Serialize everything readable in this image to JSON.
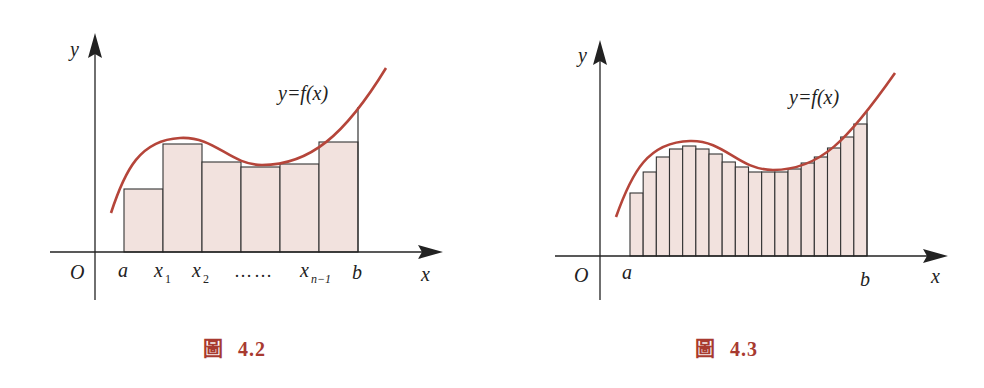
{
  "colors": {
    "curve": "#b5453a",
    "bar_fill": "#f2e2de",
    "bar_stroke": "#333333",
    "axis": "#222222",
    "caption": "#a83a30"
  },
  "figures": [
    {
      "id": "fig-4-2",
      "caption_label": "圖",
      "caption_number": "4.2",
      "axis_labels": {
        "x": "x",
        "y": "y",
        "origin": "O"
      },
      "curve_label": "y=f(x)",
      "x_tick_labels": [
        {
          "text": "a",
          "sub": ""
        },
        {
          "text": "x",
          "sub": "1"
        },
        {
          "text": "x",
          "sub": "2"
        },
        {
          "text": "……",
          "sub": ""
        },
        {
          "text": "x",
          "sub": "n−1"
        },
        {
          "text": "b",
          "sub": ""
        }
      ]
    },
    {
      "id": "fig-4-3",
      "caption_label": "圖",
      "caption_number": "4.3",
      "axis_labels": {
        "x": "x",
        "y": "y",
        "origin": "O"
      },
      "curve_label": "y=f(x)",
      "x_tick_labels": [
        {
          "text": "a",
          "sub": ""
        },
        {
          "text": "b",
          "sub": ""
        }
      ]
    }
  ],
  "chart_data": [
    {
      "type": "bar",
      "title": "圖 4.2 — Riemann sum approximation with n rectangles (left endpoints)",
      "xlabel": "x",
      "ylabel": "y",
      "curve": "y=f(x)",
      "categories": [
        "[a,x1]",
        "[x1,x2]",
        "[x2,x3]",
        "[x3,x4]",
        "[x4,xn-1]",
        "[xn-1,b]"
      ],
      "values": [
        63,
        108,
        90,
        85,
        88,
        110
      ],
      "value_units": "pixel heights above x-axis (relative)",
      "f_at_b": 145,
      "grid": false,
      "legend": "none"
    },
    {
      "type": "bar",
      "title": "圖 4.3 — Riemann sum approximation with finer partition (18 rectangles)",
      "xlabel": "x",
      "ylabel": "y",
      "curve": "y=f(x)",
      "categories": [
        "1",
        "2",
        "3",
        "4",
        "5",
        "6",
        "7",
        "8",
        "9",
        "10",
        "11",
        "12",
        "13",
        "14",
        "15",
        "16",
        "17",
        "18"
      ],
      "values": [
        63,
        84,
        99,
        107,
        110,
        107,
        102,
        94,
        89,
        84,
        84,
        84,
        87,
        93,
        99,
        108,
        119,
        132
      ],
      "value_units": "pixel heights above x-axis (relative)",
      "f_at_b": 144,
      "grid": false,
      "legend": "none"
    }
  ]
}
